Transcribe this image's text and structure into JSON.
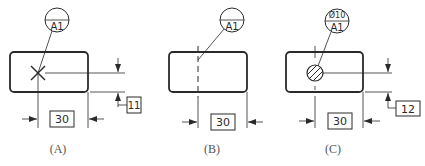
{
  "figures": [
    {
      "id": "A",
      "caption": "(A)",
      "callout": {
        "top": "",
        "bottom": "A1"
      },
      "horizontal_dimension": "30",
      "vertical_dimension": "11",
      "feature": "cross-point"
    },
    {
      "id": "B",
      "caption": "(B)",
      "callout": {
        "top": "",
        "bottom": "A1"
      },
      "horizontal_dimension": "30",
      "vertical_dimension": "",
      "feature": "dashed-line"
    },
    {
      "id": "C",
      "caption": "(C)",
      "callout": {
        "top": "Ø10",
        "bottom": "A1"
      },
      "horizontal_dimension": "30",
      "vertical_dimension": "12",
      "feature": "hatched-circle"
    }
  ],
  "colors": {
    "line": "#2a2a2a",
    "caption": "#555555",
    "background": "#ffffff"
  }
}
